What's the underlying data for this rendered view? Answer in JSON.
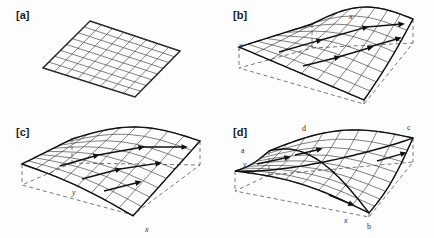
{
  "figure": {
    "background_color": "#fdfdfd",
    "line_color": "#2b2b2b",
    "bold_line_color": "#111111",
    "dashed_color": "#555555",
    "panel_count": 4,
    "grid_divisions": 8
  },
  "panels": [
    {
      "id": "a",
      "label": "[a]",
      "description": "flat quadrilateral mesh",
      "surface_type": "planar-grid",
      "axis_labels": [],
      "corner_labels": [],
      "has_dashed_base": false,
      "has_vectors": false
    },
    {
      "id": "b",
      "label": "[b]",
      "description": "warped surface with displacement vectors",
      "surface_type": "warped-grid",
      "axis_labels": [
        "x",
        "y"
      ],
      "corner_labels": [],
      "has_dashed_base": true,
      "has_vectors": true
    },
    {
      "id": "c",
      "label": "[c]",
      "description": "warped surface with displacement vectors",
      "surface_type": "warped-grid",
      "axis_labels": [
        "x",
        "y"
      ],
      "corner_labels": [],
      "has_dashed_base": true,
      "has_vectors": true
    },
    {
      "id": "d",
      "label": "[d]",
      "description": "curved saddle surface with labelled corners",
      "surface_type": "curved-grid",
      "axis_labels": [
        "x",
        "y"
      ],
      "corner_labels": [
        "a",
        "b",
        "c",
        "d"
      ],
      "has_dashed_base": true,
      "has_vectors": true
    }
  ],
  "axis_text": {
    "x": "x",
    "y": "y"
  },
  "corner_text": {
    "a": "a",
    "b": "b",
    "c": "c",
    "d": "d"
  }
}
